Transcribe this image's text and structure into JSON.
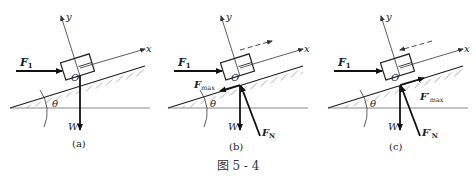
{
  "top_text": "动的最小值及最大值，以及摩擦角概念（被截断的上一行文字）",
  "figure": {
    "caption": "图 5 - 4",
    "panels": [
      {
        "id": "a",
        "label": "(a)",
        "axes": {
          "x": "x",
          "y": "y",
          "origin": "O"
        },
        "angle": "θ",
        "forces": {
          "applied": "F",
          "applied_sub": "1",
          "weight": "W"
        }
      },
      {
        "id": "b",
        "label": "(b)",
        "axes": {
          "x": "x",
          "y": "y",
          "origin": "O"
        },
        "angle": "θ",
        "motion_tendency": "up-slope (dashed arrow →)",
        "forces": {
          "applied": "F",
          "applied_sub": "1",
          "weight": "W",
          "friction": "F",
          "friction_sub": "max",
          "normal": "F",
          "normal_sub": "N"
        }
      },
      {
        "id": "c",
        "label": "(c)",
        "axes": {
          "x": "x",
          "y": "y",
          "origin": "O"
        },
        "angle": "θ",
        "motion_tendency": "down-slope (dashed arrow ←)",
        "forces": {
          "applied": "F",
          "applied_sub": "1",
          "weight": "W",
          "friction": "F′",
          "friction_sub": "max",
          "normal": "F′",
          "normal_sub": "N"
        }
      }
    ]
  }
}
